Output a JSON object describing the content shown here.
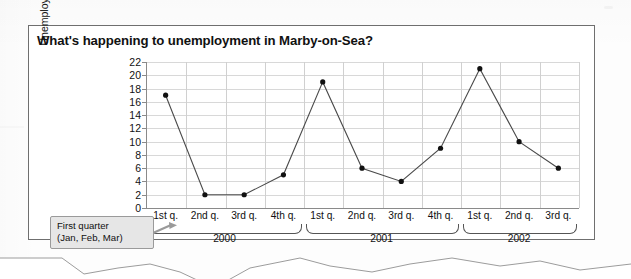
{
  "figure": {
    "title": "What's happening to unemployment in Marby-on-Sea?"
  },
  "callout": {
    "line1": "First quarter",
    "line2": "(Jan, Feb, Mar)"
  },
  "chart_data": {
    "type": "line",
    "title": "What's happening to unemployment in Marby-on-Sea?",
    "xlabel": "",
    "ylabel": "Unemployment (thousands)",
    "ylim": [
      0,
      22
    ],
    "ytick_step": 2,
    "yticks": [
      22,
      20,
      18,
      16,
      14,
      12,
      10,
      8,
      6,
      4,
      2,
      0
    ],
    "ytick_labels": [
      "22",
      "20",
      "18",
      "16",
      "14",
      "12",
      "10",
      "8",
      "6",
      "4",
      "2",
      "0"
    ],
    "grid": true,
    "legend": "none",
    "categories": [
      "1st q.",
      "2nd q.",
      "3rd q.",
      "4th q.",
      "1st q.",
      "2nd q.",
      "3rd q.",
      "4th q.",
      "1st q.",
      "2nd q.",
      "3rd q."
    ],
    "values": [
      17,
      2,
      2,
      5,
      19,
      6,
      4,
      9,
      21,
      10,
      6
    ],
    "groups": [
      {
        "label": "2000",
        "start": 0,
        "count": 4
      },
      {
        "label": "2001",
        "start": 4,
        "count": 4
      },
      {
        "label": "2002",
        "start": 8,
        "count": 3
      }
    ],
    "marker": "filled-circle",
    "line_color": "#4a4a4a",
    "marker_color": "#111111"
  }
}
